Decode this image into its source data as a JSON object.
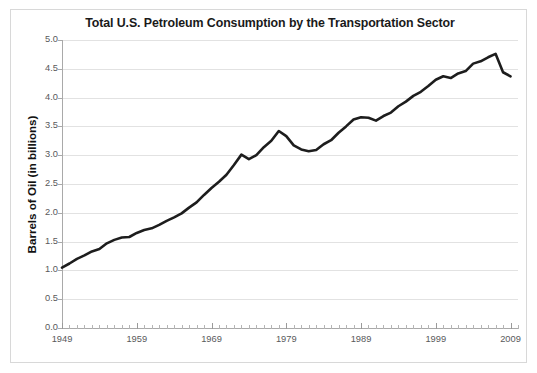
{
  "chart_data": {
    "type": "line",
    "title": "Total U.S. Petroleum Consumption by the Transportation Sector",
    "xlabel": "",
    "ylabel": "Barrels of Oil (in billions)",
    "ylim": [
      0.0,
      5.0
    ],
    "xlim": [
      1949,
      2010
    ],
    "yticks": [
      "0.0",
      "0.5",
      "1.0",
      "1.5",
      "2.0",
      "2.5",
      "3.0",
      "3.5",
      "4.0",
      "4.5",
      "5.0"
    ],
    "ytick_values": [
      0.0,
      0.5,
      1.0,
      1.5,
      2.0,
      2.5,
      3.0,
      3.5,
      4.0,
      4.5,
      5.0
    ],
    "xticks": [
      "1949",
      "1959",
      "1969",
      "1979",
      "1989",
      "1999",
      "2009"
    ],
    "xtick_values": [
      1949,
      1959,
      1969,
      1979,
      1989,
      1999,
      2009
    ],
    "grid": "horizontal",
    "legend": "none",
    "line_color": "#1d1d1d",
    "line_width": 2.6,
    "x": [
      1949,
      1950,
      1951,
      1952,
      1953,
      1954,
      1955,
      1956,
      1957,
      1958,
      1959,
      1960,
      1961,
      1962,
      1963,
      1964,
      1965,
      1966,
      1967,
      1968,
      1969,
      1970,
      1971,
      1972,
      1973,
      1974,
      1975,
      1976,
      1977,
      1978,
      1979,
      1980,
      1981,
      1982,
      1983,
      1984,
      1985,
      1986,
      1987,
      1988,
      1989,
      1990,
      1991,
      1992,
      1993,
      1994,
      1995,
      1996,
      1997,
      1998,
      1999,
      2000,
      2001,
      2002,
      2003,
      2004,
      2005,
      2006,
      2007,
      2008,
      2009
    ],
    "values": [
      1.05,
      1.12,
      1.2,
      1.26,
      1.33,
      1.37,
      1.47,
      1.53,
      1.57,
      1.58,
      1.65,
      1.7,
      1.73,
      1.79,
      1.86,
      1.92,
      1.99,
      2.09,
      2.18,
      2.31,
      2.43,
      2.54,
      2.66,
      2.83,
      3.01,
      2.93,
      3.0,
      3.14,
      3.25,
      3.42,
      3.33,
      3.17,
      3.1,
      3.07,
      3.09,
      3.19,
      3.26,
      3.39,
      3.5,
      3.62,
      3.66,
      3.65,
      3.6,
      3.68,
      3.74,
      3.85,
      3.93,
      4.03,
      4.1,
      4.2,
      4.31,
      4.37,
      4.34,
      4.42,
      4.46,
      4.59,
      4.63,
      4.7,
      4.76,
      4.44,
      4.37
    ],
    "series_name": "Total U.S. Petroleum Consumption (Transportation Sector)"
  }
}
